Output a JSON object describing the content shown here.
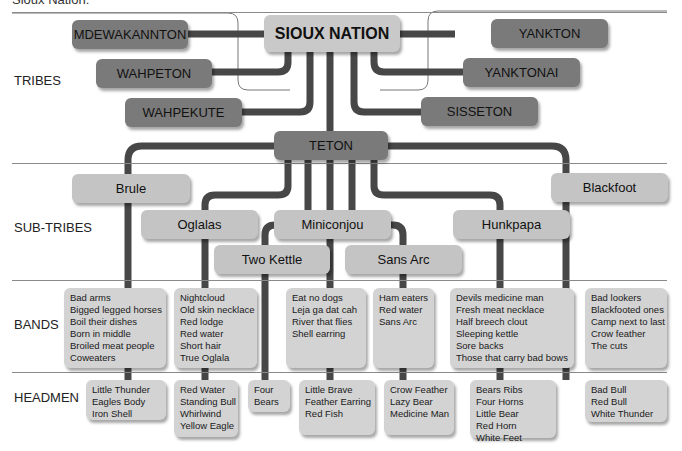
{
  "title": "Sioux Nation:",
  "row_labels": {
    "tribes": "TRIBES",
    "sub_tribes": "SUB-TRIBES",
    "bands": "BANDS",
    "headmen": "HEADMEN"
  },
  "root": "SIOUX NATION",
  "tribes": [
    "MDEWAKANNTON",
    "WAHPETON",
    "WAHPEKUTE",
    "YANKTON",
    "YANKTONAI",
    "SISSETON",
    "TETON"
  ],
  "sub_tribes": [
    "Brule",
    "Oglalas",
    "Two Kettle",
    "Miniconjou",
    "Sans Arc",
    "Hunkpapa",
    "Blackfoot"
  ],
  "bands": {
    "brule": [
      "Bad arms",
      "Bigged legged horses",
      "Boil their dishes",
      "Born in middle",
      "Broiled meat people",
      "Coweaters"
    ],
    "oglalas": [
      "Nightcloud",
      "Old skin necklace",
      "Red lodge",
      "Red water",
      "Short hair",
      "True Oglala"
    ],
    "miniconjou": [
      "Eat no dogs",
      "Leja ga dat cah",
      "River that flies",
      "Shell earring"
    ],
    "sans_arc": [
      "Ham eaters",
      "Red water",
      "Sans Arc"
    ],
    "hunkpapa": [
      "Devils medicine man",
      "Fresh meat necklace",
      "Half breech clout",
      "Sleeping kettle",
      "Sore backs",
      "Those that carry bad bows"
    ],
    "blackfoot": [
      "Bad lookers",
      "Blackfooted ones",
      "Camp next to last",
      "Crow feather",
      "The cuts"
    ]
  },
  "headmen": {
    "brule": [
      "Little Thunder",
      "Eagles Body",
      "Iron Shell"
    ],
    "oglalas": [
      "Red Water",
      "Standing Bull",
      "Whirlwind",
      "Yellow Eagle"
    ],
    "two_kettle": [
      "Four",
      "Bears"
    ],
    "miniconjou": [
      "Little Brave",
      "Feather Earring",
      "Red Fish"
    ],
    "sans_arc": [
      "Crow Feather",
      "Lazy Bear",
      "Medicine Man"
    ],
    "hunkpapa": [
      "Bears Ribs",
      "Four Horns",
      "Little Bear",
      "Red Horn",
      "White Feet"
    ],
    "blackfoot": [
      "Bad Bull",
      "Red Bull",
      "White Thunder"
    ]
  },
  "colors": {
    "connector": "#474747",
    "tribe_box": "#7a7a7a",
    "root_box": "#c9c9c9",
    "sub_box": "#c4c4c4",
    "list_box": "#d3d3d3"
  }
}
